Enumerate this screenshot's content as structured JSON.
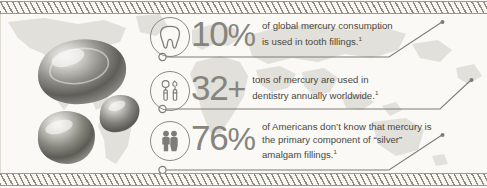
{
  "background": {
    "canvas_color": "#faf9f5",
    "map_color": "#c9c8c0",
    "border_pattern": "diagonal-hatch-stripes"
  },
  "theme": {
    "figure_color": "#86847d",
    "text_color": "#4a4842",
    "rule_color": "#8b8983",
    "droplet_color": "#8f8e88"
  },
  "graphics": {
    "world_map_name": "world-map-silhouette",
    "droplets_name": "mercury-droplets",
    "droplet_count": 3
  },
  "stats": [
    {
      "icon": "tooth-icon",
      "figure": "10",
      "unit": "%",
      "lines": [
        "of global mercury consumption",
        "is used in tooth fillings."
      ],
      "footnote": "1"
    },
    {
      "icon": "dental-tools-icon",
      "figure": "32",
      "unit": "+",
      "lines": [
        "tons of mercury are used in",
        "dentistry annually worldwide."
      ],
      "footnote": "1"
    },
    {
      "icon": "two-people-icon",
      "figure": "76",
      "unit": "%",
      "lines": [
        "of Americans don’t know that mercury is",
        "the primary component of “silver”",
        "amalgam fillings."
      ],
      "footnote": "1"
    }
  ]
}
